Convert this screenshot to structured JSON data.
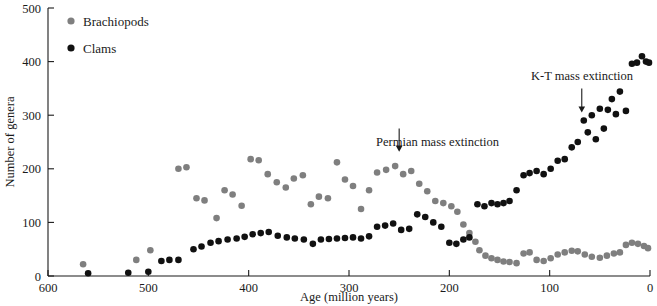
{
  "chart_data": {
    "type": "scatter",
    "title": "",
    "xlabel": "Age (million years)",
    "ylabel": "Number of genera",
    "xlim": [
      600,
      0
    ],
    "ylim": [
      0,
      500
    ],
    "x_reversed": true,
    "grid": false,
    "xticks": [
      600,
      500,
      400,
      300,
      200,
      100,
      0
    ],
    "yticks": [
      0,
      100,
      200,
      300,
      400,
      500
    ],
    "legend_position": "top-left",
    "series": [
      {
        "name": "Brachiopods",
        "color": "#7f7f7f",
        "marker": "circle",
        "points": [
          [
            565,
            22
          ],
          [
            512,
            30
          ],
          [
            498,
            48
          ],
          [
            470,
            200
          ],
          [
            462,
            203
          ],
          [
            452,
            145
          ],
          [
            444,
            141
          ],
          [
            432,
            108
          ],
          [
            424,
            160
          ],
          [
            416,
            152
          ],
          [
            407,
            131
          ],
          [
            398,
            218
          ],
          [
            390,
            216
          ],
          [
            381,
            190
          ],
          [
            372,
            175
          ],
          [
            363,
            165
          ],
          [
            355,
            182
          ],
          [
            346,
            188
          ],
          [
            338,
            134
          ],
          [
            330,
            148
          ],
          [
            321,
            145
          ],
          [
            312,
            212
          ],
          [
            304,
            180
          ],
          [
            296,
            168
          ],
          [
            288,
            125
          ],
          [
            280,
            160
          ],
          [
            272,
            193
          ],
          [
            263,
            198
          ],
          [
            254,
            205
          ],
          [
            246,
            190
          ],
          [
            238,
            196
          ],
          [
            230,
            172
          ],
          [
            222,
            158
          ],
          [
            214,
            140
          ],
          [
            206,
            136
          ],
          [
            198,
            130
          ],
          [
            192,
            120
          ],
          [
            186,
            96
          ],
          [
            180,
            80
          ],
          [
            174,
            64
          ],
          [
            170,
            48
          ],
          [
            164,
            38
          ],
          [
            158,
            33
          ],
          [
            152,
            30
          ],
          [
            146,
            27
          ],
          [
            140,
            26
          ],
          [
            133,
            24
          ],
          [
            126,
            42
          ],
          [
            120,
            44
          ],
          [
            113,
            30
          ],
          [
            106,
            28
          ],
          [
            99,
            33
          ],
          [
            92,
            40
          ],
          [
            85,
            44
          ],
          [
            78,
            47
          ],
          [
            72,
            46
          ],
          [
            65,
            40
          ],
          [
            58,
            36
          ],
          [
            50,
            34
          ],
          [
            43,
            38
          ],
          [
            36,
            42
          ],
          [
            30,
            44
          ],
          [
            24,
            58
          ],
          [
            18,
            62
          ],
          [
            12,
            60
          ],
          [
            6,
            56
          ],
          [
            2,
            52
          ]
        ]
      },
      {
        "name": "Clams",
        "color": "#111111",
        "marker": "circle",
        "points": [
          [
            560,
            5
          ],
          [
            520,
            6
          ],
          [
            500,
            8
          ],
          [
            487,
            28
          ],
          [
            479,
            30
          ],
          [
            470,
            30
          ],
          [
            455,
            50
          ],
          [
            447,
            55
          ],
          [
            438,
            62
          ],
          [
            430,
            65
          ],
          [
            421,
            68
          ],
          [
            412,
            70
          ],
          [
            404,
            73
          ],
          [
            396,
            78
          ],
          [
            388,
            80
          ],
          [
            380,
            82
          ],
          [
            371,
            75
          ],
          [
            362,
            72
          ],
          [
            354,
            70
          ],
          [
            345,
            68
          ],
          [
            336,
            60
          ],
          [
            328,
            68
          ],
          [
            320,
            69
          ],
          [
            312,
            70
          ],
          [
            304,
            71
          ],
          [
            296,
            72
          ],
          [
            288,
            70
          ],
          [
            280,
            74
          ],
          [
            272,
            92
          ],
          [
            264,
            94
          ],
          [
            256,
            98
          ],
          [
            248,
            86
          ],
          [
            240,
            88
          ],
          [
            232,
            115
          ],
          [
            224,
            110
          ],
          [
            216,
            100
          ],
          [
            208,
            92
          ],
          [
            200,
            62
          ],
          [
            193,
            60
          ],
          [
            186,
            68
          ],
          [
            180,
            72
          ],
          [
            172,
            134
          ],
          [
            165,
            130
          ],
          [
            158,
            136
          ],
          [
            152,
            134
          ],
          [
            146,
            136
          ],
          [
            140,
            140
          ],
          [
            133,
            160
          ],
          [
            126,
            188
          ],
          [
            120,
            192
          ],
          [
            113,
            196
          ],
          [
            106,
            190
          ],
          [
            99,
            200
          ],
          [
            92,
            215
          ],
          [
            85,
            218
          ],
          [
            78,
            240
          ],
          [
            72,
            250
          ],
          [
            66,
            290
          ],
          [
            62,
            268
          ],
          [
            58,
            300
          ],
          [
            54,
            255
          ],
          [
            50,
            312
          ],
          [
            46,
            275
          ],
          [
            42,
            310
          ],
          [
            38,
            330
          ],
          [
            34,
            302
          ],
          [
            30,
            344
          ],
          [
            24,
            308
          ],
          [
            18,
            396
          ],
          [
            13,
            398
          ],
          [
            8,
            410
          ],
          [
            4,
            400
          ],
          [
            1,
            398
          ]
        ]
      }
    ],
    "annotations": [
      {
        "text": "Permian mass extinction",
        "arrow_x": 250,
        "arrow_y_top": 275,
        "arrow_y_bottom": 232,
        "text_anchor": "end",
        "text_x_px": 499,
        "text_y_px": 146
      },
      {
        "text": "K-T mass extinction",
        "arrow_x": 68,
        "arrow_y_top": 350,
        "arrow_y_bottom": 305,
        "text_anchor": "middle",
        "text_x_px": 582,
        "text_y_px": 80
      }
    ]
  },
  "legend": {
    "items": [
      {
        "label": "Brachiopods",
        "color": "#7f7f7f"
      },
      {
        "label": "Clams",
        "color": "#111111"
      }
    ]
  },
  "axes": {
    "x_title": "Age (million years)",
    "y_title": "Number of genera",
    "x_tick_labels": [
      "600",
      "500",
      "400",
      "300",
      "200",
      "100",
      "0"
    ],
    "y_tick_labels": [
      "0",
      "100",
      "200",
      "300",
      "400",
      "500"
    ]
  }
}
